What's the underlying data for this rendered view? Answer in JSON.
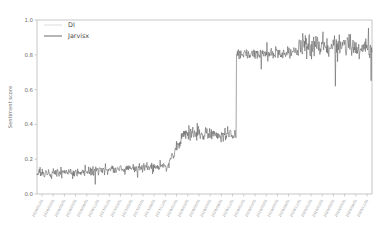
{
  "chart_data": {
    "type": "line",
    "title": "",
    "xlabel": "",
    "ylabel": "Sentiment score",
    "ylim": [
      0.0,
      1.0
    ],
    "yticks": [
      0.0,
      0.2,
      0.4,
      0.6,
      0.8,
      1.0
    ],
    "ytick_labels": [
      "0.0",
      "0.2",
      "0.4",
      "0.6",
      "0.8",
      "1.0"
    ],
    "grid": false,
    "legend_position": "upper left",
    "legend": [
      "DI",
      "Jarvisx"
    ],
    "xtick_labels": [
      "2016/01/01",
      "2016/03/01",
      "2016/05/01",
      "2016/07/01",
      "2016/09/01",
      "2016/11/01",
      "2017/01/01",
      "2017/03/01",
      "2017/05/01",
      "2017/07/01",
      "2017/09/01",
      "2017/11/01",
      "2018/01/01",
      "2018/03/01",
      "2018/05/01",
      "2018/07/01",
      "2018/09/01",
      "2018/11/01",
      "2019/01/01",
      "2019/03/01",
      "2019/05/01",
      "2019/07/01",
      "2019/09/01",
      "2019/11/01",
      "2020/01/01",
      "2020/03/01",
      "2020/05/01",
      "2020/07/01",
      "2020/09/01",
      "2020/11/01"
    ],
    "series": [
      {
        "name": "DI",
        "color": "#d9d9d9",
        "values": []
      },
      {
        "name": "Jarvisx",
        "color": "#5a5a5a",
        "baseline_segments": [
          {
            "from_frac": 0.0,
            "to_frac": 0.39,
            "level": 0.135,
            "noise": 0.03
          },
          {
            "from_frac": 0.39,
            "to_frac": 0.43,
            "level": 0.23,
            "noise": 0.035
          },
          {
            "from_frac": 0.43,
            "to_frac": 0.595,
            "level": 0.345,
            "noise": 0.038
          },
          {
            "from_frac": 0.595,
            "to_frac": 0.78,
            "level": 0.81,
            "noise": 0.04
          },
          {
            "from_frac": 0.78,
            "to_frac": 1.0,
            "level": 0.845,
            "noise": 0.075
          }
        ],
        "values": []
      }
    ],
    "annotations": [
      {
        "text": "sharp step up from ~0.35 to ~0.82",
        "x_frac": 0.595
      }
    ]
  },
  "axes": {
    "y_label": "Sentiment score",
    "y_tick_labels": [
      "1.0",
      "0.8",
      "0.6",
      "0.4",
      "0.2",
      "0.0"
    ],
    "x_tick_count": 30
  },
  "legend": {
    "items": [
      {
        "label": "DI",
        "color": "#d9d9d9"
      },
      {
        "label": "Jarvisx",
        "color": "#5a5a5a"
      }
    ]
  },
  "colors": {
    "background": "#ffffff",
    "spine": "#b8b8b8",
    "tick_text": "#6e6e6e",
    "xtick_text": "#8a8a8a",
    "series_primary": "#5a5a5a",
    "series_secondary": "#d9d9d9"
  }
}
